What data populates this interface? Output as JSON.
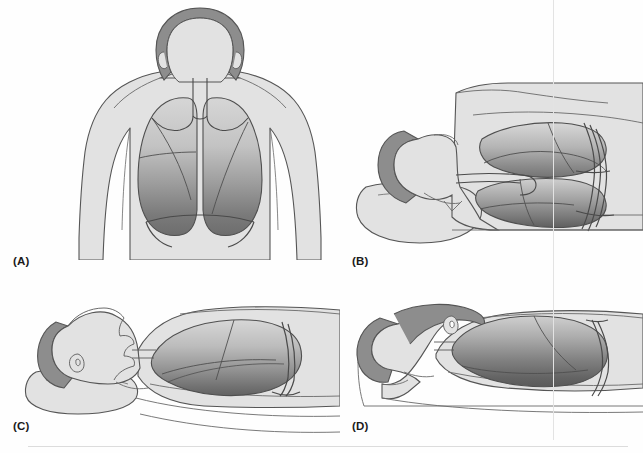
{
  "figure": {
    "background_color": "#fefefe",
    "width": 643,
    "height": 453
  },
  "palette": {
    "skin_fill": "#e2e2e2",
    "skin_stroke": "#5a5a5a",
    "hair_fill": "#8d8d8d",
    "hair_stroke": "#5a5a5a",
    "lung_light": "#d2d2d2",
    "lung_mid": "#a8a8a8",
    "lung_dark": "#6f6f6f",
    "lung_darkest": "#5c5c5c",
    "airway_stroke": "#4a4a4a",
    "outline_stroke": "#555555",
    "rule_color": "#dcdcdc",
    "vline_color": "#e3e3e3",
    "label_color": "#1a1a1a"
  },
  "panels": [
    {
      "id": "A",
      "label": "(A)",
      "position_name": "upright",
      "view": "anterior torso, standing / sitting",
      "lungs_visible": 2,
      "gradient_direction": "top-light to bottom-dark",
      "anatomy": [
        "head",
        "neck",
        "shoulders",
        "arms",
        "torso",
        "trachea",
        "left bronchus",
        "right bronchus",
        "right lung",
        "left lung",
        "horizontal fissure",
        "oblique fissure",
        "diaphragm"
      ]
    },
    {
      "id": "B",
      "label": "(B)",
      "position_name": "supine",
      "view": "lying on back, seen from head of bed",
      "lungs_visible": 2,
      "gradient_direction": "anterior-light to posterior-dark",
      "anatomy": [
        "head on pillow",
        "pillow",
        "shoulder",
        "trunk",
        "upper lung",
        "lower lung",
        "trachea",
        "bronchial tree",
        "mattress"
      ]
    },
    {
      "id": "C",
      "label": "(C)",
      "position_name": "supine lateral view",
      "view": "lying on back, side profile",
      "lungs_visible": 1,
      "gradient_direction": "upper-light to lower-dark",
      "anatomy": [
        "head on pillow",
        "pillow",
        "face profile",
        "ear",
        "neck",
        "chest",
        "lung",
        "fissure",
        "bronchus",
        "mattress"
      ]
    },
    {
      "id": "D",
      "label": "(D)",
      "position_name": "prone",
      "view": "lying face down, side profile",
      "lungs_visible": 1,
      "gradient_direction": "upper-light to lower-dark",
      "anatomy": [
        "head turned on bed",
        "ear",
        "neck",
        "back",
        "lung",
        "fissure",
        "bronchus",
        "mattress"
      ]
    }
  ],
  "icons": {
    "scan_vertical_line": "scan-vertical-line",
    "scan_horizontal_rule": "scan-horizontal-rule"
  }
}
